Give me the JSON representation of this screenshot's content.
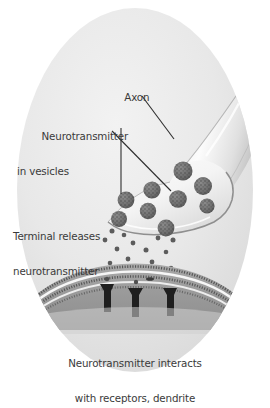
{
  "figure": {
    "background_color": "#ffffff",
    "cell_fill_color": "#e3e3e3",
    "text_color": "#3a3a3a",
    "vesicle_color": "#6e6e6e",
    "dendrite_color": "#9a9a9a",
    "receptor_color": "#262626"
  },
  "labels": {
    "axon": "Axon",
    "vesicles_line1": "Neurotransmitter",
    "vesicles_line2": "in vesicles",
    "terminal_line1": "Terminal releases",
    "terminal_line2": "neurotransmitter",
    "dendrite_line1": "Neurotransmitter interacts",
    "dendrite_line2": "with receptors, dendrite"
  },
  "structures": {
    "cell_body": "oval-neuron-background",
    "axon_shaft": "axon-shaft",
    "axon_terminal": "axon-terminal-bouton",
    "synaptic_cleft": "synaptic-cleft",
    "dendrite_membrane": "dendrite-lipid-bilayer",
    "receptors_count": 3,
    "vesicles_count": 9,
    "free_transmitter_count": 14
  },
  "leader_lines": {
    "axon": "from Axon label down-right to axon shaft",
    "vesicles_a": "from vesicles label down to left vesicle",
    "vesicles_b": "from vesicles label diagonally down-right to vesicle"
  }
}
